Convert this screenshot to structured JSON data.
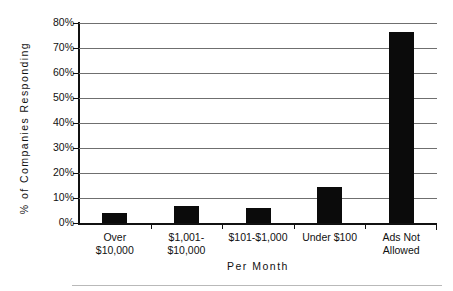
{
  "chart_data": {
    "type": "bar",
    "title": "",
    "categories": [
      "Over\n$10,000",
      "$1,001-\n$10,000",
      "$101-$1,000",
      "Under $100",
      "Ads Not\nAllowed"
    ],
    "category_lines": [
      [
        "Over",
        "$10,000"
      ],
      [
        "$1,001-",
        "$10,000"
      ],
      [
        "$101-$1,000",
        ""
      ],
      [
        "Under $100",
        ""
      ],
      [
        "Ads Not",
        "Allowed"
      ]
    ],
    "values": [
      4,
      7,
      6,
      14.5,
      76.5
    ],
    "xlabel": "Per Month",
    "ylabel": "% of Companies Responding",
    "ylim": [
      0,
      80
    ],
    "ytick_values": [
      0,
      10,
      20,
      30,
      40,
      50,
      60,
      70,
      80
    ],
    "ytick_labels": [
      "0%",
      "10%",
      "20%",
      "30%",
      "40%",
      "50%",
      "60%",
      "70%",
      "80%"
    ],
    "grid": true,
    "legend": false,
    "bar_color": "#0b0b0b",
    "gridline_color": "#6f6f6f",
    "axis_color": "#111111"
  }
}
